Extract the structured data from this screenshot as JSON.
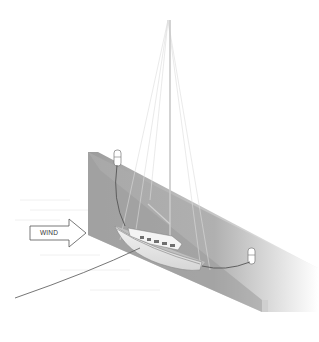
{
  "illustration": {
    "subject": "Sailboat moored alongside quay wall",
    "wind_arrow": {
      "label": "WIND",
      "direction": "right"
    },
    "elements": [
      "quay-wall",
      "bollard-bow",
      "bollard-stern",
      "bow-line",
      "stern-line",
      "anchor-line",
      "sailboat",
      "mast",
      "rigging",
      "water"
    ],
    "colors": {
      "background": "#ffffff",
      "wall_front": "#a9a9a9",
      "wall_top": "#bdbdbd",
      "wall_shadow": "#8c8c8c",
      "hull": "#e6e6e6",
      "line": "#555555"
    }
  }
}
